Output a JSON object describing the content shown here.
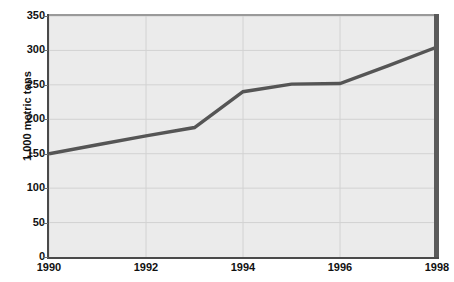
{
  "chart_data": {
    "type": "line",
    "title": "",
    "xlabel": "",
    "ylabel": "1,000 metric tons",
    "xlim": [
      1990,
      1998
    ],
    "ylim": [
      0,
      350
    ],
    "grid": true,
    "legend": false,
    "y_ticks": [
      350,
      300,
      250,
      200,
      150,
      100,
      50,
      0
    ],
    "y_tick_labels": [
      "350",
      "300",
      "250",
      "200",
      "150",
      "100",
      "50",
      "0"
    ],
    "x_ticks": [
      1990,
      1992,
      1994,
      1996,
      1998
    ],
    "x_tick_labels": [
      "1990",
      "1992",
      "1994",
      "1996",
      "1998"
    ],
    "x_gridlines": [
      1990,
      1992,
      1994,
      1996,
      1998
    ],
    "series": [
      {
        "name": "1,000 metric tons",
        "color": "#555555",
        "x": [
          1990,
          1991,
          1992,
          1993,
          1994,
          1995,
          1996,
          1997,
          1998
        ],
        "values": [
          150,
          163,
          176,
          188,
          240,
          251,
          252,
          278,
          305
        ]
      }
    ]
  },
  "colors": {
    "line": "#555555",
    "plot_background": "#ebebeb",
    "grid": "#d2d2d2",
    "axis": "#4a4a4a",
    "axis_right": "#5a5a5a",
    "text": "#111111",
    "page_background": "#ffffff"
  },
  "axes": {
    "y_title": "1,000 metric tons"
  }
}
